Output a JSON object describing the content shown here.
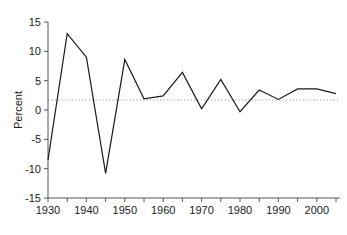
{
  "figure": {
    "background_color": "#ffffff",
    "line_color": "#1a1a1a",
    "axis_color": "#555555",
    "zero_line_color": "#9a9a9a",
    "corner_artifact": "partial-figure-label-fragment"
  },
  "chart_data": {
    "type": "line",
    "title": "",
    "subtitle": "",
    "xlabel": "",
    "ylabel": "Percent",
    "x": [
      1930,
      1935,
      1940,
      1945,
      1950,
      1955,
      1960,
      1965,
      1970,
      1975,
      1980,
      1985,
      1990,
      1995,
      2000,
      2005
    ],
    "values": [
      -8.5,
      13.0,
      9.0,
      -10.8,
      8.6,
      1.9,
      2.4,
      6.4,
      0.2,
      5.2,
      -0.3,
      3.4,
      1.8,
      3.6,
      3.6,
      2.8
    ],
    "series": [
      {
        "name": "Percent",
        "values": [
          -8.5,
          13.0,
          9.0,
          -10.8,
          8.6,
          1.9,
          2.4,
          6.4,
          0.2,
          5.2,
          -0.3,
          3.4,
          1.8,
          3.6,
          3.6,
          2.8
        ]
      }
    ],
    "xlim": [
      1930,
      2005
    ],
    "ylim": [
      -15,
      15
    ],
    "yticks": [
      -15,
      -10,
      -5,
      0,
      5,
      10,
      15
    ],
    "ytick_labels": [
      "-15",
      "-10",
      "-5",
      "0",
      "5",
      "10",
      "15"
    ],
    "xticks": [
      1930,
      1935,
      1940,
      1945,
      1950,
      1955,
      1960,
      1965,
      1970,
      1975,
      1980,
      1985,
      1990,
      1995,
      2000,
      2005
    ],
    "xtick_labels_major": [
      "1930",
      "1940",
      "1950",
      "1960",
      "1970",
      "1980",
      "1990",
      "2000"
    ],
    "xticks_major": [
      1930,
      1940,
      1950,
      1960,
      1970,
      1980,
      1990,
      2000
    ],
    "grid": false,
    "zero_reference_line": true,
    "zero_reference_value": 0,
    "zero_reference_style": "dotted",
    "legend": null,
    "legend_position": "none",
    "annotations": []
  }
}
